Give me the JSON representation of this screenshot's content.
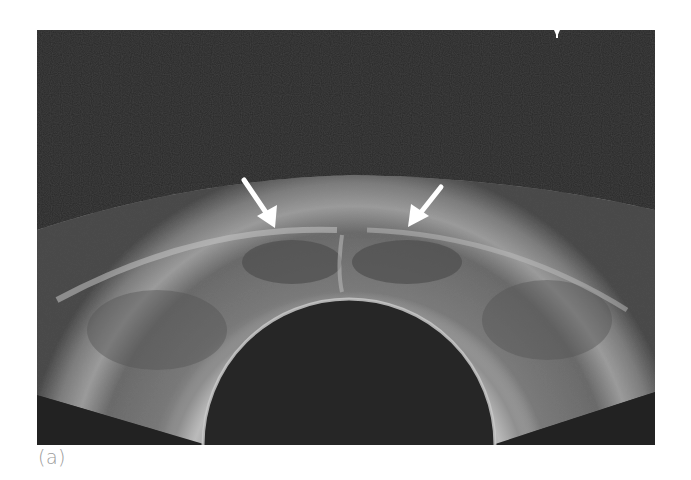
{
  "figure": {
    "type": "transrectal-ultrasound",
    "caption": "(a)",
    "annotations": [
      {
        "name": "arrow-left",
        "from": [
          244,
          180
        ],
        "to": [
          275,
          228
        ],
        "color": "#ffffff"
      },
      {
        "name": "arrow-right",
        "from": [
          441,
          187
        ],
        "to": [
          408,
          227
        ],
        "color": "#ffffff"
      }
    ],
    "colors": {
      "background": "#262626",
      "tissue": "#6e6e6e",
      "bright_echo": "#c8c8c8",
      "probe": "#262626",
      "page": "#ffffff",
      "caption": "#9a9a9a"
    }
  }
}
